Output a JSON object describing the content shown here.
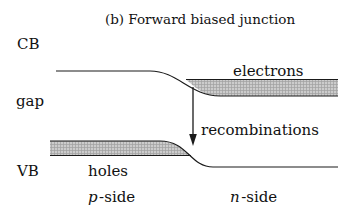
{
  "title": "(b) Forward biased junction",
  "axis_labels": {
    "cb": "CB",
    "gap": "gap",
    "vb": "VB"
  },
  "labels": {
    "electrons": "electrons",
    "recombinations": "recombinations",
    "holes": "holes",
    "p_side": {
      "prefix": "p",
      "suffix": "-side"
    },
    "n_side": {
      "prefix": "n",
      "suffix": "-side"
    }
  },
  "colors": {
    "line": "#1a1a1a",
    "text": "#111111",
    "hatch_base": "#cccccc",
    "hatch_grid": "#a0a0a0",
    "background": "#ffffff"
  }
}
